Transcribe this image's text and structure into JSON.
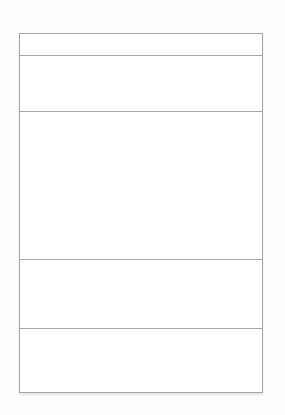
{
  "canvas": {
    "width": 285,
    "height": 415,
    "background": "#fdfdfd"
  },
  "wireframe": {
    "border_color": "#a6a6a6",
    "fill_color": "#fefefe",
    "shadow_color": "rgba(0,0,0,0.10)",
    "panel": {
      "left": 19,
      "top": 33,
      "width": 244,
      "height": 360
    },
    "rows": [
      {
        "name": "header-strip",
        "height": 21
      },
      {
        "name": "upper-band",
        "height": 55
      },
      {
        "name": "main-content-area",
        "height": 147
      },
      {
        "name": "lower-band-first",
        "height": 68
      },
      {
        "name": "lower-band-second",
        "height": 67
      }
    ]
  }
}
